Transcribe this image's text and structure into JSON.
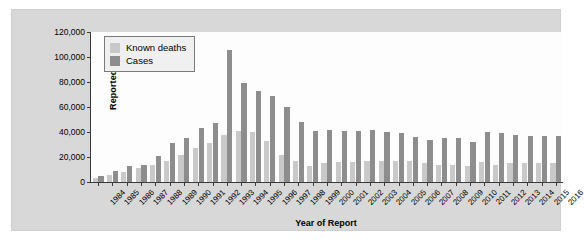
{
  "chart_data": {
    "type": "bar",
    "title": "",
    "xlabel": "Year of Report",
    "ylabel": "Reported Cases",
    "ylim": [
      0,
      120000
    ],
    "yticks": [
      0,
      20000,
      40000,
      60000,
      80000,
      100000,
      120000
    ],
    "ytick_labels": [
      "0",
      "20,000",
      "40,000",
      "60,000",
      "80,000",
      "100,000",
      "120,000"
    ],
    "grid": false,
    "legend_position": "upper-left-inside",
    "categories": [
      "1984",
      "1985",
      "1986",
      "1987",
      "1988",
      "1989",
      "1990",
      "1991",
      "1992",
      "1993",
      "1994",
      "1995",
      "1996",
      "1997",
      "1998",
      "1999",
      "2000",
      "2001",
      "2002",
      "2003",
      "2004",
      "2005",
      "2006",
      "2007",
      "2008",
      "2009",
      "2010",
      "2011",
      "2012",
      "2013",
      "2014",
      "2015",
      "2016"
    ],
    "series": [
      {
        "name": "Known deaths",
        "color": "#c9c9c9",
        "values": [
          3000,
          6000,
          8000,
          11000,
          14000,
          17000,
          22000,
          27000,
          31000,
          38000,
          41000,
          40000,
          33000,
          22000,
          17000,
          13000,
          15000,
          16000,
          16000,
          17000,
          17000,
          17000,
          17000,
          15000,
          14000,
          14000,
          13000,
          16000,
          14000,
          15000,
          15000,
          15000,
          15000
        ]
      },
      {
        "name": "Cases",
        "color": "#8d8d8d",
        "values": [
          4500,
          9000,
          13000,
          13500,
          21000,
          31000,
          35000,
          43000,
          47000,
          106000,
          79000,
          73000,
          69000,
          60000,
          48000,
          41000,
          42000,
          41000,
          41000,
          42000,
          40000,
          39000,
          36000,
          34000,
          35000,
          35000,
          32000,
          40000,
          39000,
          38000,
          37000,
          37000,
          37000
        ]
      }
    ]
  }
}
